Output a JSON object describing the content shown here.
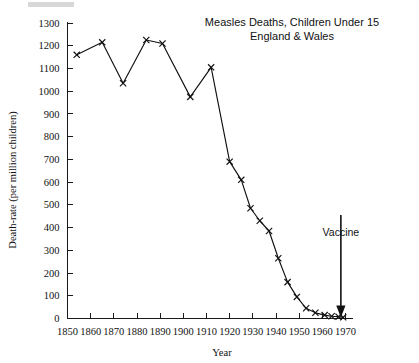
{
  "chart_data": {
    "type": "line",
    "title": "Measles Deaths, Children Under 15",
    "subtitle": "England & Wales",
    "xlabel": "Year",
    "ylabel": "Death-rate (per million children)",
    "xlim": [
      1850,
      1970
    ],
    "ylim": [
      0,
      1300
    ],
    "grid": false,
    "legend": null,
    "marker": "x",
    "xticks": [
      1850,
      1860,
      1870,
      1880,
      1890,
      1900,
      1910,
      1920,
      1930,
      1940,
      1950,
      1960,
      1970
    ],
    "yticks": [
      0,
      100,
      200,
      300,
      400,
      500,
      600,
      700,
      800,
      900,
      1000,
      1100,
      1200,
      1300
    ],
    "xtick_labels": [
      "1850",
      "1860",
      "1870",
      "1880",
      "1890",
      "1900",
      "1910",
      "1920",
      "1930",
      "1940",
      "1950",
      "1960",
      "1970"
    ],
    "ytick_labels": [
      "0",
      "100",
      "200",
      "300",
      "400",
      "500",
      "600",
      "700",
      "800",
      "900",
      "1000",
      "1100",
      "1200",
      "1300"
    ],
    "series": [
      {
        "name": "Measles death-rate",
        "x": [
          1854,
          1865,
          1874,
          1884,
          1891,
          1903,
          1912,
          1920,
          1925,
          1929,
          1933,
          1937,
          1941,
          1945,
          1949,
          1953,
          1957,
          1961,
          1964,
          1967,
          1969
        ],
        "values": [
          1160,
          1215,
          1035,
          1225,
          1210,
          975,
          1105,
          690,
          610,
          485,
          430,
          385,
          265,
          160,
          95,
          45,
          25,
          15,
          10,
          8,
          5
        ]
      }
    ],
    "annotations": [
      {
        "label": "Vaccine",
        "x": 1968,
        "y": 0,
        "text_y": 420,
        "arrow": "down"
      }
    ]
  },
  "axis": {
    "x_title": "Year",
    "y_title": "Death-rate (per million children)"
  },
  "colors": {
    "line": "#111111",
    "axis": "#1a1a1a",
    "background": "#ffffff"
  }
}
